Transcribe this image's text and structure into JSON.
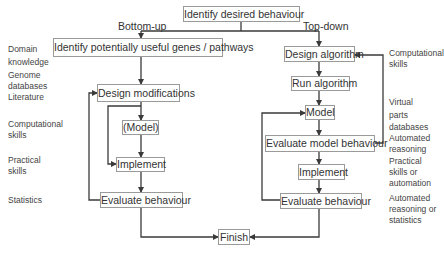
{
  "root": {
    "label": "Identify desired behaviour"
  },
  "branches": {
    "bottom_up": "Bottom-up",
    "top_down": "Top-down"
  },
  "bottom_up_steps": [
    {
      "id": "identify-genes",
      "label": "Identify potentially useful genes / pathways"
    },
    {
      "id": "design-modifications",
      "label": "Design modifications"
    },
    {
      "id": "model",
      "label": "(Model)"
    },
    {
      "id": "implement",
      "label": "Implement"
    },
    {
      "id": "evaluate",
      "label": "Evaluate behaviour"
    }
  ],
  "top_down_steps": [
    {
      "id": "design-algorithm",
      "label": "Design algorithm"
    },
    {
      "id": "run-algorithm",
      "label": "Run algorithm"
    },
    {
      "id": "model",
      "label": "Model"
    },
    {
      "id": "evaluate-model",
      "label": "Evaluate model behaviour"
    },
    {
      "id": "implement",
      "label": "Implement"
    },
    {
      "id": "evaluate",
      "label": "Evaluate behaviour"
    }
  ],
  "finish": {
    "label": "Finish"
  },
  "left_annotations": [
    "Domain knowledge",
    "Genome databases Literature",
    "Computational skills",
    "Practical skills",
    "Statistics"
  ],
  "left_annotation_lines": {
    "domain1": "Domain",
    "domain2": "knowledge",
    "genome1": "Genome",
    "genome2": "databases",
    "genome3": "Literature",
    "comp1": "Computational",
    "comp2": "skills",
    "prac1": "Practical",
    "prac2": "skills",
    "stats": "Statistics"
  },
  "right_annotation_lines": {
    "comp1": "Computational",
    "comp2": "skills",
    "virt1": "Virtual",
    "virt2": "parts",
    "virt3": "databases",
    "auto1": "Automated",
    "auto2": "reasoning",
    "prac1": "Practical",
    "prac2": "skills or",
    "prac3": "automation",
    "ar1": "Automated",
    "ar2": "reasoning or",
    "ar3": "statistics"
  },
  "colors": {
    "line": "#3a3a3a",
    "box_border": "#9a9a9a",
    "text": "#333333"
  }
}
